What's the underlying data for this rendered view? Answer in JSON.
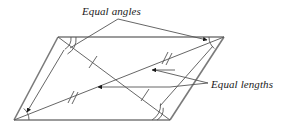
{
  "figure": {
    "type": "geometry-diagram",
    "background_color": "#ffffff",
    "stroke_color": "#4d4d4d",
    "outline_color": "#6b6b6b",
    "text_color": "#1a1a1a",
    "width": 284,
    "height": 132,
    "annotations": {
      "equal_angles": {
        "label": "Equal angles",
        "x": 82,
        "y": 5
      },
      "equal_lengths": {
        "label": "Equal lengths",
        "x": 211,
        "y": 78
      }
    },
    "shape": {
      "name": "parallelogram",
      "vertices": [
        {
          "id": "top-left",
          "x": 58,
          "y": 37
        },
        {
          "id": "top-right",
          "x": 224,
          "y": 37
        },
        {
          "id": "bottom-right",
          "x": 170,
          "y": 120
        },
        {
          "id": "bottom-left",
          "x": 14,
          "y": 120
        }
      ],
      "edges": [
        {
          "from": "top-left",
          "to": "top-right"
        },
        {
          "from": "top-right",
          "to": "bottom-right"
        },
        {
          "from": "bottom-right",
          "to": "bottom-left"
        },
        {
          "from": "bottom-left",
          "to": "top-left"
        }
      ],
      "diagonals": [
        {
          "id": "diagonal-tl-br",
          "from": "top-left",
          "to": "bottom-right",
          "ticks": 1
        },
        {
          "id": "diagonal-bl-tr",
          "from": "bottom-left",
          "to": "top-right",
          "ticks": 1
        },
        {
          "id": "diagonal-segment-upper",
          "ticks": 2
        },
        {
          "id": "diagonal-segment-lower",
          "ticks": 2
        }
      ],
      "angle_arcs": [
        {
          "vertex": "top-left",
          "arc_count": 2
        },
        {
          "vertex": "top-right",
          "arc_count": 1
        },
        {
          "vertex": "bottom-right",
          "arc_count": 2
        },
        {
          "vertex": "bottom-left",
          "arc_count": 1
        }
      ],
      "tick_marks": [
        {
          "id": "tick-upper-left-single",
          "count": 1,
          "x": 93,
          "y": 62
        },
        {
          "id": "tick-upper-right-double",
          "count": 2,
          "x": 166,
          "y": 58
        },
        {
          "id": "tick-lower-left-double",
          "count": 2,
          "x": 71,
          "y": 97
        },
        {
          "id": "tick-lower-right-single",
          "count": 1,
          "x": 145,
          "y": 95
        }
      ],
      "arrowheads": [
        {
          "id": "arrow-to-top-right-vertex",
          "x": 207,
          "y": 40,
          "direction": "right"
        },
        {
          "id": "arrow-to-bottom-left-vertex",
          "x": 32,
          "y": 108,
          "direction": "left"
        },
        {
          "id": "arrow-to-upper-diagonal",
          "x": 152,
          "y": 70,
          "direction": "left"
        },
        {
          "id": "arrow-to-lower-diagonal",
          "x": 98,
          "y": 92,
          "direction": "left"
        }
      ]
    }
  }
}
